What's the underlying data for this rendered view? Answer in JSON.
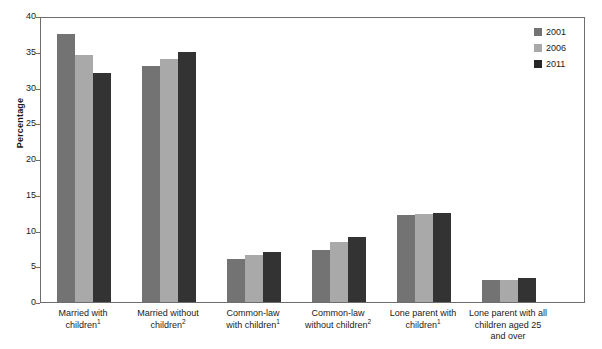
{
  "chart_data": {
    "type": "bar",
    "title": "",
    "subtitle": "",
    "xlabel": "",
    "ylabel": "Percentage",
    "ylim": [
      0,
      40
    ],
    "yticks": [
      0,
      5,
      10,
      15,
      20,
      25,
      30,
      35,
      40
    ],
    "ytick_labels": [
      "0",
      "5",
      "10",
      "15",
      "20",
      "25",
      "30",
      "35",
      "40"
    ],
    "grid": false,
    "legend_position": "top-right",
    "categories": [
      "Married with children¹",
      "Married without children²",
      "Common-law with children¹",
      "Common-law without children²",
      "Lone parent with children¹",
      "Lone parent with all children aged 25 and over"
    ],
    "category_lines": [
      [
        "Married with",
        "children",
        "1"
      ],
      [
        "Married without",
        "children",
        "2"
      ],
      [
        "Common-law",
        "with children",
        "1"
      ],
      [
        "Common-law",
        "without children",
        "2"
      ],
      [
        "Lone parent with",
        "children",
        "1"
      ],
      [
        "Lone parent with all",
        "children aged 25",
        "and over",
        ""
      ]
    ],
    "series": [
      {
        "name": "2001",
        "color": "#737373",
        "values": [
          37.5,
          33.0,
          6.0,
          7.3,
          12.2,
          3.1
        ]
      },
      {
        "name": "2006",
        "color": "#a9a9a9",
        "values": [
          34.5,
          34.0,
          6.6,
          8.4,
          12.3,
          3.1
        ]
      },
      {
        "name": "2011",
        "color": "#333333",
        "values": [
          32.0,
          35.0,
          7.0,
          9.1,
          12.5,
          3.4
        ]
      }
    ],
    "annotations": []
  },
  "legend": {
    "items": [
      {
        "label": "2001"
      },
      {
        "label": "2006"
      },
      {
        "label": "2011"
      }
    ]
  },
  "colors": {
    "series_2001": "#737373",
    "series_2006": "#a9a9a9",
    "series_2011": "#333333",
    "axis": "#6e6e6e",
    "text": "#1a1a1a",
    "background": "#ffffff"
  }
}
